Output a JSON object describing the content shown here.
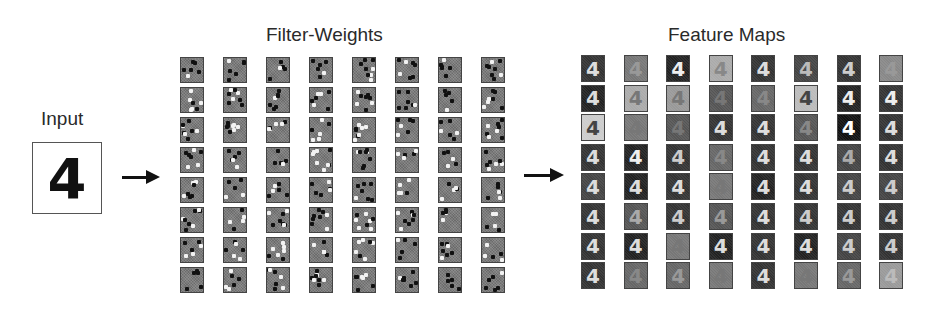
{
  "labels": {
    "input": "Input",
    "filter_weights": "Filter-Weights",
    "feature_maps": "Feature Maps"
  },
  "input_digit": "4",
  "feature_digit": "4",
  "filter_grid": {
    "rows": 8,
    "cols": 8
  },
  "feature_grid": {
    "rows": 8,
    "cols": 8,
    "cells": [
      [
        [
          "#333",
          "#ddd"
        ],
        [
          "#777",
          "#999"
        ],
        [
          "#222",
          "#eee"
        ],
        [
          "#aaa",
          "#888"
        ],
        [
          "#333",
          "#ddd"
        ],
        [
          "#444",
          "#bbb"
        ],
        [
          "#333",
          "#ccc"
        ],
        [
          "#888",
          "#999"
        ]
      ],
      [
        [
          "#222",
          "#ddd"
        ],
        [
          "#aaa",
          "#777"
        ],
        [
          "#999",
          "#777"
        ],
        [
          "#555",
          "#777"
        ],
        [
          "#666",
          "#888"
        ],
        [
          "#bbb",
          "#444"
        ],
        [
          "#222",
          "#eee"
        ],
        [
          "#333",
          "#eee"
        ]
      ],
      [
        [
          "#ccc",
          "#444"
        ],
        [
          "#777",
          "#777"
        ],
        [
          "#555",
          "#777"
        ],
        [
          "#333",
          "#ddd"
        ],
        [
          "#333",
          "#ddd"
        ],
        [
          "#555",
          "#888"
        ],
        [
          "#111",
          "#fff"
        ],
        [
          "#333",
          "#ddd"
        ]
      ],
      [
        [
          "#333",
          "#ddd"
        ],
        [
          "#222",
          "#eee"
        ],
        [
          "#333",
          "#ccc"
        ],
        [
          "#666",
          "#888"
        ],
        [
          "#333",
          "#ddd"
        ],
        [
          "#333",
          "#ddd"
        ],
        [
          "#444",
          "#aaa"
        ],
        [
          "#333",
          "#ddd"
        ]
      ],
      [
        [
          "#444",
          "#ddd"
        ],
        [
          "#222",
          "#ddd"
        ],
        [
          "#333",
          "#ddd"
        ],
        [
          "#777",
          "#777"
        ],
        [
          "#222",
          "#ddd"
        ],
        [
          "#333",
          "#ddd"
        ],
        [
          "#444",
          "#ccc"
        ],
        [
          "#444",
          "#ccc"
        ]
      ],
      [
        [
          "#333",
          "#ddd"
        ],
        [
          "#555",
          "#aaa"
        ],
        [
          "#333",
          "#ccc"
        ],
        [
          "#555",
          "#999"
        ],
        [
          "#333",
          "#ddd"
        ],
        [
          "#333",
          "#ccc"
        ],
        [
          "#333",
          "#ccc"
        ],
        [
          "#333",
          "#ccc"
        ]
      ],
      [
        [
          "#333",
          "#ddd"
        ],
        [
          "#222",
          "#ddd"
        ],
        [
          "#777",
          "#777"
        ],
        [
          "#222",
          "#ddd"
        ],
        [
          "#333",
          "#ddd"
        ],
        [
          "#222",
          "#ddd"
        ],
        [
          "#444",
          "#ccc"
        ],
        [
          "#333",
          "#ccc"
        ]
      ],
      [
        [
          "#333",
          "#ddd"
        ],
        [
          "#666",
          "#888"
        ],
        [
          "#666",
          "#999"
        ],
        [
          "#777",
          "#777"
        ],
        [
          "#333",
          "#ddd"
        ],
        [
          "#777",
          "#777"
        ],
        [
          "#666",
          "#999"
        ],
        [
          "#999",
          "#bbb"
        ]
      ]
    ]
  },
  "colors": {
    "filter_bg": "#7a7a7a",
    "dot_dark": "#111111",
    "dot_light": "#f2f2f2",
    "arrow": "#111111"
  }
}
